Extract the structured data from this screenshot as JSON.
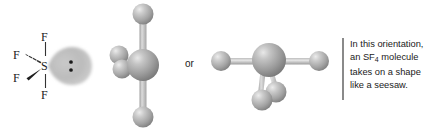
{
  "figure": {
    "background_color": "#ffffff"
  },
  "lewis_structure": {
    "center_atom": "S",
    "fluorine_top": "F",
    "fluorine_bottom": "F",
    "fluorine_dashed": "F",
    "fluorine_wedge": "F",
    "lone_pair_dots": 2,
    "lone_pair_color": "#b9b9b9",
    "bond_color": "#333333",
    "label_color": "#222222"
  },
  "connector": {
    "or_label": "or"
  },
  "model_left": {
    "name": "ball-and-stick-axial-view",
    "central_atom_color": "#9b9b9b",
    "terminal_atom_color": "#a8a8a8",
    "bond_color": "#bdbdbd",
    "atom_count": 5
  },
  "model_right": {
    "name": "ball-and-stick-seesaw-view",
    "central_atom_color": "#9b9b9b",
    "terminal_atom_color": "#a8a8a8",
    "bond_color": "#bdbdbd",
    "atom_count": 5
  },
  "callout": {
    "rule_color": "#8a8a8a",
    "line1": "In this orientation,",
    "line2_pre": "an SF",
    "line2_sub": "4",
    "line2_post": " molecule",
    "line3": "takes on a shape",
    "line4": "like a seesaw."
  }
}
